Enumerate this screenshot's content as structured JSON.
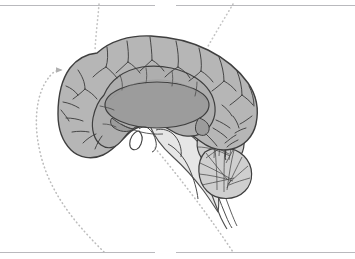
{
  "figure": {
    "kind": "anatomical-illustration",
    "width": 355,
    "height": 259,
    "background_color": "#ffffff"
  },
  "palette": {
    "background": "#ffffff",
    "cortex_fill": "#b4b4b4",
    "cortex_inner_fill": "#aeaeae",
    "corpus_callosum_fill": "#9b9b9b",
    "cerebellum_fill": "#c9c9c9",
    "brainstem_fill": "#e3e3e3",
    "outline_stroke": "#3f3f3f",
    "detail_stroke": "#4a4a4a",
    "leader_line": "#b5b5b5",
    "rule_line": "#b9b9bd"
  },
  "regions": [
    {
      "id": "cerebral-cortex",
      "label": "cerebral cortex",
      "fill": "#b4b4b4"
    },
    {
      "id": "cingulate-gyrus",
      "label": "cingulate gyrus",
      "fill": "#aeaeae"
    },
    {
      "id": "corpus-callosum",
      "label": "corpus callosum",
      "fill": "#9b9b9b"
    },
    {
      "id": "cerebellum",
      "label": "cerebellum",
      "fill": "#c9c9c9"
    },
    {
      "id": "brainstem",
      "label": "brainstem",
      "fill": "#e3e3e3"
    },
    {
      "id": "pituitary-gland",
      "label": "pituitary gland",
      "fill": "#ffffff"
    },
    {
      "id": "spinal-cord",
      "label": "spinal cord",
      "fill": "#ffffff"
    }
  ],
  "leader_lines": [
    {
      "id": "leader-left-arrow",
      "style": "dotted",
      "has_arrowhead": true,
      "color": "#b5b5b5"
    },
    {
      "id": "leader-top-left",
      "style": "dotted",
      "has_arrowhead": false,
      "color": "#c2c2c2"
    },
    {
      "id": "leader-top-right",
      "style": "dotted",
      "has_arrowhead": false,
      "color": "#c2c2c2"
    },
    {
      "id": "leader-bottom-right",
      "style": "dotted",
      "has_arrowhead": false,
      "color": "#bdbdbd"
    }
  ],
  "label_rules": [
    {
      "id": "rule-top-left",
      "text": "",
      "x": 0,
      "y": 5,
      "width": 155
    },
    {
      "id": "rule-top-right",
      "text": "",
      "x": 176,
      "y": 5,
      "width": 179
    },
    {
      "id": "rule-bottom-left",
      "text": "",
      "x": 0,
      "y": 252,
      "width": 155
    },
    {
      "id": "rule-bottom-right",
      "text": "",
      "x": 176,
      "y": 252,
      "width": 179
    }
  ]
}
